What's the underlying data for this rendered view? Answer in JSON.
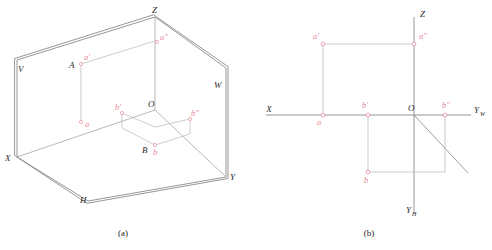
{
  "figure_a": {
    "caption": "(a)",
    "labels": {
      "plane_v": "V",
      "plane_w": "W",
      "plane_h": "H",
      "axis_x": "X",
      "axis_y": "Y",
      "axis_z": "Z",
      "origin": "O",
      "point_A": "A",
      "point_B": "B",
      "proj_a_front": "a'",
      "proj_a_side": "a″",
      "proj_a_top": "a",
      "proj_b_front": "b'",
      "proj_b_side": "b″",
      "proj_b_top": "b"
    }
  },
  "figure_b": {
    "caption": "(b)",
    "labels": {
      "axis_x": "X",
      "axis_z": "Z",
      "axis_yw": "Y",
      "axis_yw_sub": "W",
      "axis_yh": "Y",
      "axis_yh_sub": "H",
      "origin": "O",
      "proj_a_front": "a'",
      "proj_a_side": "a″",
      "proj_a_top": "a",
      "proj_b_front": "b'",
      "proj_b_side": "b″",
      "proj_b_top": "b"
    }
  },
  "colors": {
    "line": "#8a8a8a",
    "line_dark": "#6e6e6e",
    "label_black": "#2b2b2b",
    "label_pink": "#e8889b",
    "background": "#ffffff"
  }
}
